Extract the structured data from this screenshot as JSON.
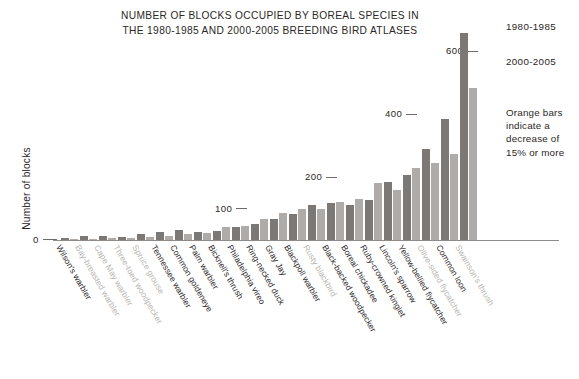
{
  "chart_data": {
    "type": "bar",
    "title": "NUMBER OF BLOCKS OCCUPIED BY BOREAL SPECIES IN\nTHE 1980-1985 AND 2000-2005 BREEDING BIRD ATLASES",
    "xlabel": "",
    "ylabel": "Number of blocks",
    "ylim": [
      0,
      700
    ],
    "grid": false,
    "legend_position": "right",
    "yticks": [
      0,
      100,
      200,
      400,
      600
    ],
    "ytick_labels": [
      "0",
      "100",
      "200",
      "400",
      "600"
    ],
    "categories": [
      "Wilson's warbler",
      "Bay-breasted warbler",
      "Cape May warbler",
      "Three-toed woodpecker",
      "Spruce grouse",
      "Tennessee warbler",
      "Common goldeneye",
      "Palm warbler",
      "Bicknell's thrush",
      "Philadelphia vireo",
      "Ring-necked duck",
      "Gray Jay",
      "Blackpoll warbler",
      "Rusty blackbird",
      "Black-backed woodpecker",
      "Boreal chickadee",
      "Ruby-crowned kinglet",
      "Lincoln's sparrow",
      "Yellow-bellied flycatcher",
      "Olive-sided flycatcher",
      "Common loon",
      "Swainson's thrush"
    ],
    "category_faded": [
      false,
      true,
      true,
      true,
      true,
      false,
      false,
      false,
      false,
      false,
      false,
      false,
      false,
      true,
      false,
      false,
      false,
      false,
      false,
      true,
      false,
      true
    ],
    "series": [
      {
        "name": "1980-1985",
        "color": "#7b7876",
        "values": [
          5,
          13,
          12,
          10,
          18,
          24,
          32,
          24,
          30,
          40,
          52,
          67,
          83,
          110,
          118,
          112,
          127,
          185,
          207,
          290,
          385,
          660
        ]
      },
      {
        "name": "2000-2005",
        "color": "#aeaba8",
        "values": [
          2,
          4,
          7,
          5,
          10,
          12,
          18,
          22,
          40,
          44,
          67,
          87,
          100,
          98,
          122,
          132,
          180,
          160,
          230,
          246,
          275,
          483
        ]
      }
    ],
    "annotations": [
      "Orange bars indicate a decrease of 15% or more"
    ]
  },
  "legend": {
    "series_1_label": "1980-1985",
    "series_2_label": "2000-2005",
    "note": "Orange bars indicate a decrease of 15% or more"
  },
  "axis": {
    "y_label": "Number of blocks"
  }
}
